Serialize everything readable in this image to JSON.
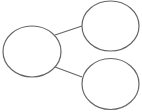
{
  "diagram": {
    "stroke_color": "#666666",
    "background": "#ffffff",
    "nodes": [
      {
        "id": "left",
        "cx": 32,
        "cy": 51.5,
        "rx": 29,
        "ry": 25.5
      },
      {
        "id": "top-right",
        "cx": 110.5,
        "cy": 26,
        "rx": 28.5,
        "ry": 25
      },
      {
        "id": "bottom-right",
        "cx": 110.5,
        "cy": 84,
        "rx": 28.5,
        "ry": 25.5
      }
    ],
    "edges": [
      {
        "from": "left",
        "to": "top-right",
        "x1": 55,
        "y1": 35,
        "x2": 82,
        "y2": 26
      },
      {
        "from": "left",
        "to": "bottom-right",
        "x1": 55,
        "y1": 67,
        "x2": 82,
        "y2": 77
      }
    ]
  }
}
